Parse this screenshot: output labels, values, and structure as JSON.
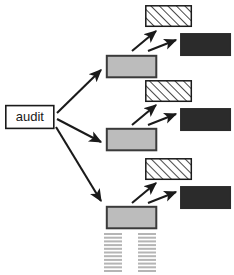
{
  "canvas": {
    "width": 234,
    "height": 275,
    "background": "#ffffff"
  },
  "diagram": {
    "type": "tree",
    "title_text": "audit",
    "root": {
      "label": "audit",
      "shape": "rectangle",
      "fill": "#ffffff",
      "stroke": "#1a1a1a",
      "x": 5,
      "y": 105,
      "width": 49,
      "height": 24
    },
    "branch_count": 3,
    "styles": {
      "gray_fill": "#bcbcbc",
      "gray_stroke": "#3a3a3a",
      "dark_fill": "#2b2b2b",
      "dark_stroke": "#2b2b2b",
      "hatch_fill": "#ffffff",
      "hatch_stroke": "#1a1a1a",
      "hatch_line_color": "#1a1a1a",
      "arrow_color": "#1a1a1a",
      "dash_color": "#b5b5b5"
    },
    "branches": [
      {
        "name": "branch-1",
        "gray_node": {
          "x": 106,
          "y": 55,
          "width": 51,
          "height": 23
        },
        "hatched_node": {
          "x": 145,
          "y": 5,
          "width": 47,
          "height": 22
        },
        "dark_node": {
          "x": 180,
          "y": 33,
          "width": 51,
          "height": 23
        }
      },
      {
        "name": "branch-2",
        "gray_node": {
          "x": 106,
          "y": 128,
          "width": 51,
          "height": 23
        },
        "hatched_node": {
          "x": 145,
          "y": 80,
          "width": 47,
          "height": 22
        },
        "dark_node": {
          "x": 180,
          "y": 108,
          "width": 51,
          "height": 23
        }
      },
      {
        "name": "branch-3",
        "gray_node": {
          "x": 106,
          "y": 206,
          "width": 51,
          "height": 23
        },
        "hatched_node": {
          "x": 145,
          "y": 158,
          "width": 47,
          "height": 22
        },
        "dark_node": {
          "x": 180,
          "y": 186,
          "width": 51,
          "height": 23
        }
      }
    ],
    "continuation": {
      "columns": [
        {
          "name": "continuation-column-left",
          "x": 104,
          "width": 18
        },
        {
          "name": "continuation-column-right",
          "x": 138,
          "width": 18
        }
      ],
      "y_start": 233,
      "dash_count": 11,
      "dash_spacing": 3.7,
      "dash_thickness": 2
    }
  }
}
